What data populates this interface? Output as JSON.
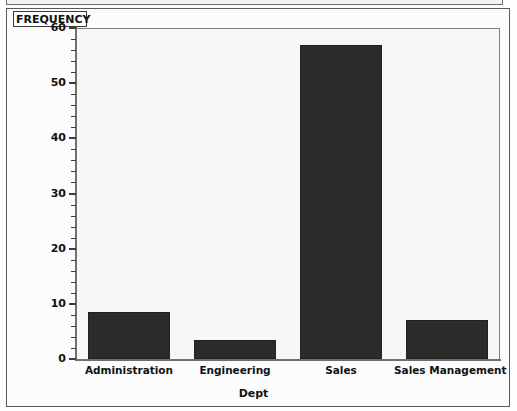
{
  "window": {
    "title_strip": ""
  },
  "legend_box": {
    "label": "FREQUENCY"
  },
  "chart_data": {
    "type": "bar",
    "title": "",
    "subtitle": "",
    "categories": [
      "Administration",
      "Engineering",
      "Sales",
      "Sales Management"
    ],
    "values": [
      8.5,
      3.5,
      57,
      7
    ],
    "series": [
      {
        "name": "FREQUENCY",
        "values": [
          8.5,
          3.5,
          57,
          7
        ]
      }
    ],
    "xlabel": "Dept",
    "ylabel": "FREQUENCY",
    "ylim": [
      0,
      60
    ],
    "xlim": [
      0,
      4
    ],
    "y_ticks": [
      0,
      10,
      20,
      30,
      40,
      50,
      60
    ],
    "y_tick_labels": [
      "0",
      "10",
      "20",
      "30",
      "40",
      "50",
      "60"
    ],
    "y_minor_tick_step": 2,
    "grid": false,
    "legend_position": "top-left-box",
    "bar_color": "#2b2b2b",
    "plot_background": "#f7f7f8",
    "axis_color": "#6f6f6f"
  }
}
